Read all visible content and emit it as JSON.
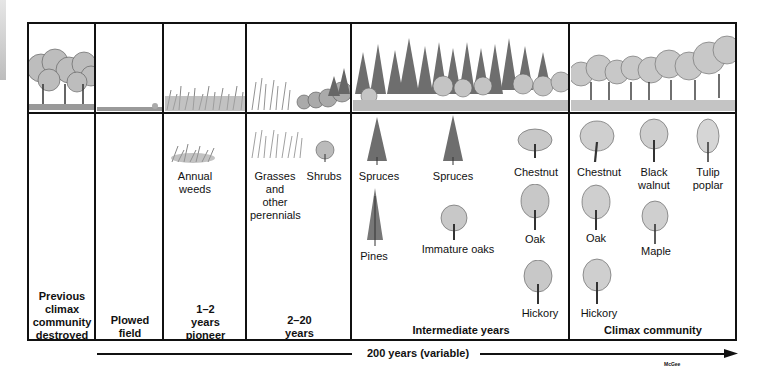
{
  "stages": [
    {
      "id": "destroyed",
      "label": "Previous climax community destroyed",
      "lines": [
        "Previous",
        "climax",
        "community",
        "destroyed"
      ]
    },
    {
      "id": "plowed",
      "label": "Plowed field",
      "lines": [
        "Plowed",
        "field"
      ]
    },
    {
      "id": "pioneer",
      "label": "1–2 years pioneer",
      "lines": [
        "1–2",
        "years",
        "pioneer"
      ],
      "plants": [
        {
          "name": "Annual weeds",
          "lines": [
            "Annual",
            "weeds"
          ]
        }
      ]
    },
    {
      "id": "perennials",
      "label": "2–20 years",
      "lines": [
        "2–20",
        "years"
      ],
      "plants": [
        {
          "name": "Grasses and other perennials",
          "lines": [
            "Grasses",
            "and",
            "other",
            "perennials"
          ]
        },
        {
          "name": "Shrubs",
          "lines": [
            "Shrubs"
          ]
        }
      ]
    },
    {
      "id": "intermediate",
      "label": "Intermediate years",
      "plants": [
        {
          "name": "Spruces"
        },
        {
          "name": "Spruces"
        },
        {
          "name": "Chestnut"
        },
        {
          "name": "Pines"
        },
        {
          "name": "Immature oaks"
        },
        {
          "name": "Oak"
        },
        {
          "name": "Hickory"
        }
      ]
    },
    {
      "id": "climax",
      "label": "Climax community",
      "plants": [
        {
          "name": "Chestnut"
        },
        {
          "name": "Black walnut",
          "lines": [
            "Black",
            "walnut"
          ]
        },
        {
          "name": "Tulip poplar",
          "lines": [
            "Tulip",
            "poplar"
          ]
        },
        {
          "name": "Oak"
        },
        {
          "name": "Maple"
        },
        {
          "name": "Hickory"
        }
      ]
    }
  ],
  "timeline": {
    "label": "200 years (variable)"
  },
  "credit": "McGee",
  "colors": {
    "line": "#111111",
    "sketch": "#6b6b6b",
    "background": "#ffffff"
  }
}
